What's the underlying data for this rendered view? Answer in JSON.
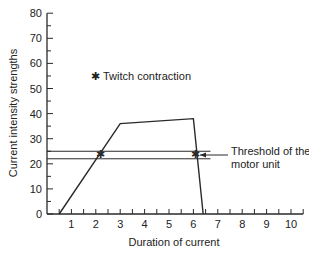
{
  "chart_data": {
    "type": "line",
    "title": "",
    "xlabel": "Duration of current",
    "ylabel": "Current intensity strengths",
    "xlim": [
      0,
      10.5
    ],
    "ylim": [
      0,
      80
    ],
    "x_ticks": [
      1,
      2,
      3,
      4,
      5,
      6,
      7,
      8,
      9,
      10
    ],
    "y_ticks": [
      0,
      10,
      20,
      30,
      40,
      50,
      60,
      70,
      80
    ],
    "grid": false,
    "series": [
      {
        "name": "Current pulse",
        "x": [
          0.5,
          3.0,
          6.0,
          6.4
        ],
        "y": [
          0,
          36,
          38,
          0
        ]
      }
    ],
    "threshold_lines": [
      {
        "y": 25,
        "x_start": 0,
        "x_end": 6.7
      },
      {
        "y": 22,
        "x_start": 0,
        "x_end": 6.7
      }
    ],
    "markers": [
      {
        "x": 2.2,
        "y": 24,
        "symbol": "star",
        "label": "Twitch contraction"
      },
      {
        "x": 6.1,
        "y": 24,
        "symbol": "star",
        "label": "Twitch contraction"
      }
    ],
    "legend": {
      "symbol": "✱",
      "text": "Twitch contraction",
      "position": "upper-left-inside"
    },
    "annotations": [
      {
        "text_line1": "Threshold of the",
        "text_line2": "motor unit",
        "arrow": "left",
        "points_to_y": 23.5
      }
    ]
  },
  "labels": {
    "xlabel": "Duration of current",
    "ylabel": "Current intensity strengths",
    "legend_text": "Twitch contraction",
    "legend_symbol": "✱",
    "threshold_line1": "Threshold of the",
    "threshold_line2": "motor unit",
    "x_tick_labels": [
      "1",
      "2",
      "3",
      "4",
      "5",
      "6",
      "7",
      "8",
      "9",
      "10"
    ],
    "y_tick_labels": [
      "0",
      "10",
      "20",
      "30",
      "40",
      "50",
      "60",
      "70",
      "80"
    ]
  },
  "colors": {
    "line": "#2a2a2a",
    "text": "#222222",
    "background": "#ffffff"
  }
}
